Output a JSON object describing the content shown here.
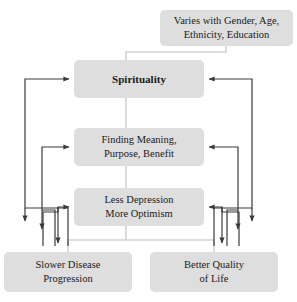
{
  "diagram": {
    "colors": {
      "node_fill": "#dedede",
      "node_text": "#1a1a1a",
      "arrow_stroke": "#3a3a3a",
      "connector_stroke": "#d2d2d2",
      "background": "#ffffff"
    },
    "nodes": [
      {
        "id": "context",
        "label": "Varies with Gender, Age,\nEthnicity, Education",
        "bold": false
      },
      {
        "id": "spirituality",
        "label": "Spirituality",
        "bold": true
      },
      {
        "id": "meaning",
        "label": "Finding Meaning,\nPurpose, Benefit",
        "bold": false
      },
      {
        "id": "depression",
        "label": "Less Depression\nMore Optimism",
        "bold": false
      },
      {
        "id": "slower_disease",
        "label": "Slower Disease\nProgression",
        "bold": false
      },
      {
        "id": "better_quality",
        "label": "Better Quality\nof Life",
        "bold": false
      }
    ],
    "connectors": [
      {
        "from": "context",
        "to": "spirituality",
        "style": "plain"
      },
      {
        "from": "spirituality",
        "to": "meaning",
        "style": "plain"
      },
      {
        "from": "meaning",
        "to": "depression",
        "style": "plain"
      },
      {
        "from": "depression",
        "to": "slower_disease",
        "style": "plain"
      },
      {
        "from": "depression",
        "to": "better_quality",
        "style": "plain"
      }
    ],
    "arrows": [
      {
        "from": "slower_disease",
        "to": "spirituality",
        "side": "left"
      },
      {
        "from": "slower_disease",
        "to": "meaning",
        "side": "left"
      },
      {
        "from": "slower_disease",
        "to": "depression",
        "side": "left"
      },
      {
        "from": "better_quality",
        "to": "spirituality",
        "side": "right"
      },
      {
        "from": "better_quality",
        "to": "meaning",
        "side": "right"
      },
      {
        "from": "better_quality",
        "to": "depression",
        "side": "right"
      }
    ]
  }
}
